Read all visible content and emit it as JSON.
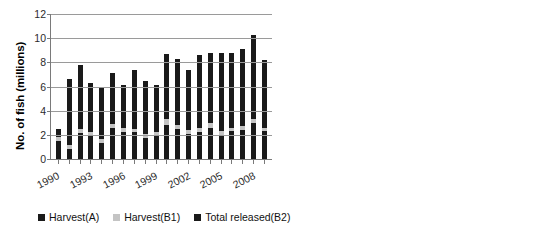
{
  "chart_data": [
    {
      "type": "bar",
      "id": "fish-count-chart",
      "title": "",
      "xlabel": "",
      "ylabel": "No. of fish (millions)",
      "ylim": [
        0,
        12
      ],
      "yticks": [
        0,
        2,
        4,
        6,
        8,
        10,
        12
      ],
      "grid": true,
      "stacked": true,
      "legend_position": "bottom",
      "x": [
        1990,
        1991,
        1992,
        1993,
        1994,
        1995,
        1996,
        1997,
        1998,
        1999,
        2000,
        2001,
        2002,
        2003,
        2004,
        2005,
        2006,
        2007,
        2008,
        2009
      ],
      "tick_labels": [
        "1990",
        "1993",
        "1996",
        "1999",
        "2002",
        "2005",
        "2008"
      ],
      "tick_label_years": [
        1990,
        1993,
        1996,
        1999,
        2002,
        2005,
        2008
      ],
      "series": [
        {
          "name": "Harvest(A)",
          "color": "#1a1a1a",
          "values": [
            1.5,
            0.85,
            2.15,
            1.9,
            1.35,
            2.6,
            2.25,
            2.2,
            1.75,
            1.9,
            2.85,
            2.5,
            2.1,
            2.25,
            2.6,
            2.0,
            2.3,
            2.4,
            2.95,
            2.3
          ]
        },
        {
          "name": "Harvest(B1)",
          "color": "#c4c4c4",
          "values": [
            0.3,
            0.3,
            0.3,
            0.3,
            0.3,
            0.3,
            0.3,
            0.3,
            0.3,
            0.3,
            0.45,
            0.35,
            0.3,
            0.35,
            0.35,
            0.3,
            0.3,
            0.3,
            0.35,
            0.3
          ]
        },
        {
          "name": "Total released(B2)",
          "color": "#1a1a1a",
          "values": [
            0.65,
            5.45,
            5.35,
            4.1,
            4.25,
            4.25,
            3.55,
            4.9,
            4.4,
            3.9,
            5.4,
            5.4,
            4.95,
            6.0,
            5.85,
            6.5,
            6.2,
            6.4,
            7.0,
            5.6
          ]
        }
      ],
      "totals": [
        2.45,
        6.6,
        7.8,
        6.3,
        5.9,
        7.15,
        6.1,
        7.4,
        6.45,
        6.1,
        8.7,
        8.25,
        7.35,
        8.6,
        8.8,
        8.8,
        8.8,
        9.1,
        10.3,
        8.2
      ]
    },
    {
      "type": "bar",
      "id": "pounds-chart",
      "title": "",
      "xlabel": "",
      "ylabel": "Lb (millions)",
      "ylim": [
        0,
        16
      ],
      "yticks": [
        0,
        2,
        4,
        6,
        8,
        10,
        12,
        14,
        16
      ],
      "grid": true,
      "stacked": false,
      "x": [
        1990,
        1991,
        1992,
        1993,
        1994,
        1995,
        1996,
        1997,
        1998,
        1999,
        2000,
        2001,
        2002,
        2003,
        2004,
        2005,
        2006,
        2007,
        2008,
        2009
      ],
      "tick_labels": [
        "1990",
        "1993",
        "1996",
        "1999",
        "2002",
        "2005",
        "2008"
      ],
      "tick_label_years": [
        1990,
        1993,
        1996,
        1999,
        2002,
        2005,
        2008
      ],
      "values": [
        4.0,
        5.35,
        7.8,
        8.7,
        7.5,
        12.1,
        11.85,
        12.2,
        8.5,
        9.25,
        14.25,
        13.45,
        11.6,
        13.15,
        14.45,
        11.05,
        11.45,
        13.25,
        14.5,
        11.8
      ],
      "color": "#1a1a1a"
    }
  ],
  "left_chart": {
    "ylabel": "No. of fish (millions)",
    "ytick_labels": [
      "12",
      "10",
      "8",
      "6",
      "4",
      "2",
      "0"
    ],
    "xtick_labels": [
      "1990",
      "1993",
      "1996",
      "1999",
      "2002",
      "2005",
      "2008"
    ]
  },
  "right_chart": {
    "ylabel": "Lb (millions)",
    "ytick_labels": [
      "16",
      "14",
      "12",
      "10",
      "8",
      "6",
      "4",
      "2",
      "0"
    ],
    "xtick_labels": [
      "1990",
      "1993",
      "1996",
      "1999",
      "2002",
      "2005",
      "2008"
    ]
  },
  "legend": {
    "items": [
      {
        "label": "Harvest(A)",
        "color": "#1a1a1a"
      },
      {
        "label": "Harvest(B1)",
        "color": "#c4c4c4"
      },
      {
        "label": "Total released(B2)",
        "color": "#1a1a1a"
      }
    ]
  }
}
